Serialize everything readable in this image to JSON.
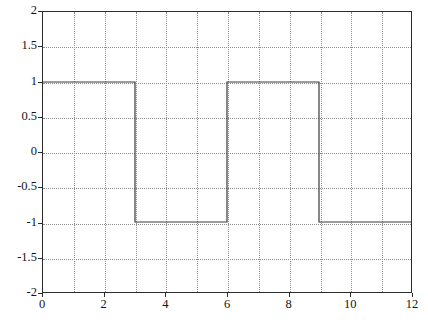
{
  "figure": {
    "title": "",
    "background_color": "#ffffff",
    "axis_color": "#2b2b2b",
    "grid_color": "#8d8d8d",
    "line_color": "#3a3a3a"
  },
  "chart_data": {
    "type": "line",
    "title": "",
    "xlabel": "",
    "ylabel": "",
    "xlim": [
      0,
      12
    ],
    "ylim": [
      -2,
      2
    ],
    "grid": true,
    "legend": null,
    "x_ticks": [
      0,
      2,
      4,
      6,
      8,
      10,
      12
    ],
    "x_tick_labels": [
      "0",
      "2",
      "4",
      "6",
      "8",
      "10",
      "12"
    ],
    "x_minor_gridlines": [
      1,
      2,
      3,
      4,
      5,
      6,
      7,
      8,
      9,
      10,
      11
    ],
    "y_ticks": [
      2,
      1.5,
      1,
      0.5,
      0,
      -0.5,
      -1,
      -1.5,
      -2
    ],
    "y_tick_labels": [
      "2",
      "1.5",
      "1",
      "0.5",
      "0",
      "-0.5",
      "-1",
      "-1.5",
      "-2"
    ],
    "series": [
      {
        "name": "square wave",
        "color": "#3a3a3a",
        "linewidth": 1.2,
        "x": [
          0,
          3,
          3,
          6,
          6,
          9,
          9,
          12
        ],
        "y": [
          1,
          1,
          -1,
          -1,
          1,
          1,
          -1,
          -1
        ]
      }
    ]
  }
}
